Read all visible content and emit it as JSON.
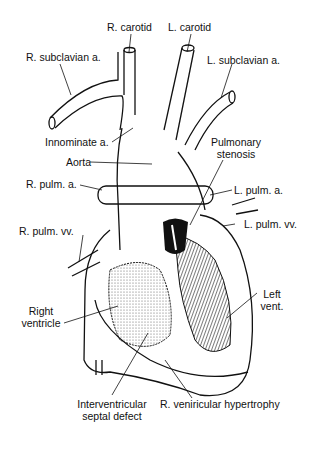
{
  "diagram": {
    "type": "anatomical-illustration",
    "labels": {
      "r_carotid": "R. carotid",
      "l_carotid": "L. carotid",
      "r_subclavian": "R. subclavian a.",
      "l_subclavian": "L. subclavian a.",
      "innominate": "Innominate a.",
      "aorta": "Aorta",
      "pulm_stenosis_1": "Pulmonary",
      "pulm_stenosis_2": "stenosis",
      "r_pulm_a": "R. pulm. a.",
      "l_pulm_a": "L. pulm. a.",
      "r_pulm_vv": "R. pulm. vv.",
      "l_pulm_vv": "L. pulm. vv.",
      "left_vent_1": "Left",
      "left_vent_2": "vent.",
      "right_vent_1": "Right",
      "right_vent_2": "ventricle",
      "ivsd_1": "Interventricular",
      "ivsd_2": "septal defect",
      "rvh": "R. veniricular hypertrophy"
    },
    "colors": {
      "line": "#111111",
      "background": "#ffffff",
      "shade": "#555555"
    }
  }
}
